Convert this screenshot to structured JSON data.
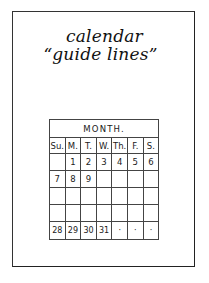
{
  "title": {
    "line1": "calendar",
    "line2": "“guide lines”"
  },
  "calendar": {
    "month_label": "MONTH.",
    "day_headers": [
      "Su.",
      "M.",
      "T.",
      "W.",
      "Th.",
      "F.",
      "S."
    ],
    "weeks": [
      [
        "",
        "1",
        "2",
        "3",
        "4",
        "5",
        "6"
      ],
      [
        "7",
        "8",
        "9",
        "",
        "",
        "",
        ""
      ],
      [
        "",
        "",
        "",
        "",
        "",
        "",
        ""
      ],
      [
        "",
        "",
        "",
        "",
        "",
        "",
        ""
      ],
      [
        "28",
        "29",
        "30",
        "31",
        "·",
        "·",
        "·"
      ]
    ]
  }
}
